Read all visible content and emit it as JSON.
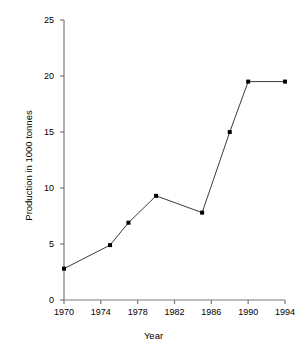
{
  "chart_data": {
    "type": "line",
    "title": "",
    "xlabel": "Year",
    "ylabel": "Production in 1000 tonnes",
    "xlim": [
      1970,
      1994
    ],
    "ylim": [
      0,
      25
    ],
    "grid": false,
    "legend": "none",
    "marker": "square",
    "line_color": "#3a3a3a",
    "marker_color": "#000000",
    "axis_color": "#7a7a7a",
    "xticks": [
      1970,
      1974,
      1978,
      1982,
      1986,
      1990,
      1994
    ],
    "xtick_labels": [
      "1970",
      "1974",
      "1978",
      "1982",
      "1986",
      "1990",
      "1994"
    ],
    "yticks": [
      0,
      5,
      10,
      15,
      20,
      25
    ],
    "ytick_labels": [
      "0",
      "5",
      "10",
      "15",
      "20",
      "25"
    ],
    "x": [
      1970,
      1975,
      1977,
      1980,
      1985,
      1988,
      1990,
      1994
    ],
    "values": [
      2.8,
      4.9,
      6.9,
      9.3,
      7.8,
      15.0,
      19.5,
      19.5
    ],
    "points": [
      {
        "x": 1970,
        "y": 2.8
      },
      {
        "x": 1975,
        "y": 4.9
      },
      {
        "x": 1977,
        "y": 6.9
      },
      {
        "x": 1980,
        "y": 9.3
      },
      {
        "x": 1985,
        "y": 7.8
      },
      {
        "x": 1988,
        "y": 15.0
      },
      {
        "x": 1990,
        "y": 19.5
      },
      {
        "x": 1994,
        "y": 19.5
      }
    ]
  }
}
